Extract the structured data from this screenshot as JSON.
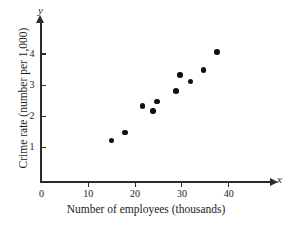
{
  "chart_data": {
    "type": "scatter",
    "title": "",
    "xlabel": "Number of employees (thousands)",
    "ylabel": "Crime rate (number per 1,000)",
    "x_axis_letter": "x",
    "y_axis_letter": "y",
    "xlim": [
      0,
      49
    ],
    "ylim": [
      0,
      4.8
    ],
    "grid": false,
    "legend": null,
    "xticks": [
      0,
      10,
      20,
      30,
      40
    ],
    "xtick_labels": [
      "0",
      "10",
      "20",
      "30",
      "40"
    ],
    "yticks": [
      1,
      2,
      3,
      4
    ],
    "ytick_labels": [
      "1",
      "2",
      "3",
      "4"
    ],
    "marker_color": "#111111",
    "axis_color": "#2b2b2b",
    "points": [
      {
        "x": 14.9,
        "y": 1.22
      },
      {
        "x": 17.8,
        "y": 1.48
      },
      {
        "x": 21.6,
        "y": 2.33
      },
      {
        "x": 23.8,
        "y": 2.17
      },
      {
        "x": 24.7,
        "y": 2.48
      },
      {
        "x": 28.7,
        "y": 2.81
      },
      {
        "x": 29.6,
        "y": 3.32
      },
      {
        "x": 31.8,
        "y": 3.11
      },
      {
        "x": 34.6,
        "y": 3.48
      },
      {
        "x": 37.5,
        "y": 4.07
      }
    ]
  }
}
